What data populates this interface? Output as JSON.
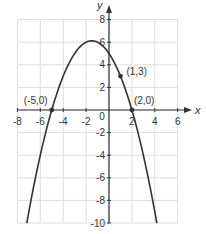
{
  "chart_data": {
    "type": "line",
    "title": "",
    "xlabel": "x",
    "ylabel": "y",
    "xlim": [
      -8,
      6
    ],
    "ylim": [
      -10,
      8
    ],
    "grid": true,
    "x_ticks": [
      -8,
      -6,
      -4,
      -2,
      0,
      2,
      4,
      6
    ],
    "x_tick_labels": [
      "-8",
      "-6",
      "-4",
      "-2",
      "0",
      "2",
      "4",
      "6"
    ],
    "y_ticks": [
      8,
      6,
      4,
      2,
      -2,
      -4,
      -6,
      -8,
      -10
    ],
    "y_tick_labels": [
      "8",
      "6",
      "4",
      "2",
      "-2",
      "-4",
      "-6",
      "-8",
      "-10"
    ],
    "series": [
      {
        "name": "parabola",
        "equation": "y = -0.5x^2 - 1.5x + 5",
        "coefficients": {
          "a": -0.5,
          "b": -1.5,
          "c": 5
        },
        "x_range": [
          -7.18,
          4.18
        ],
        "vertex": [
          -1.5,
          6.125
        ],
        "color": "#333333"
      }
    ],
    "points": [
      {
        "x": -5,
        "y": 0,
        "label": "(-5,0)"
      },
      {
        "x": 1,
        "y": 3,
        "label": "(1,3)"
      },
      {
        "x": 2,
        "y": 0,
        "label": "(2,0)"
      }
    ],
    "colors": {
      "grid": "#dddddd",
      "axis": "#333333",
      "curve": "#333333",
      "text": "#333333"
    }
  }
}
